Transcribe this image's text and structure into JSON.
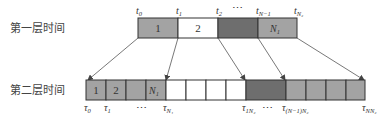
{
  "rows": {
    "top": {
      "label": "第一层时间"
    },
    "bottom": {
      "label": "第二层时间"
    }
  },
  "top_row": {
    "cells": [
      {
        "text": "1",
        "fill": "#a3a3a3"
      },
      {
        "text": "2",
        "fill": "#ffffff"
      },
      {
        "text": "",
        "fill": "#6e6e6e"
      },
      {
        "text": "N",
        "sub": "1",
        "fill": "#a3a3a3"
      }
    ],
    "ticks": [
      {
        "base": "t",
        "sub": "0"
      },
      {
        "base": "t",
        "sub": "1"
      },
      {
        "base": "t",
        "sub": "2"
      },
      {
        "base": "⋯",
        "sub": ""
      },
      {
        "base": "t",
        "sub": "N−1"
      },
      {
        "base": "t",
        "sub": "N₂"
      }
    ]
  },
  "bottom_row": {
    "cells": [
      {
        "text": "1",
        "fill": "#a3a3a3"
      },
      {
        "text": "2",
        "fill": "#a3a3a3"
      },
      {
        "text": "",
        "fill": "#a3a3a3"
      },
      {
        "text": "N",
        "sub": "1",
        "fill": "#a3a3a3"
      },
      {
        "text": "",
        "fill": "#ffffff"
      },
      {
        "text": "",
        "fill": "#ffffff"
      },
      {
        "text": "",
        "fill": "#ffffff"
      },
      {
        "text": "",
        "fill": "#ffffff"
      },
      {
        "text": "",
        "fill": "#6e6e6e"
      },
      {
        "text": "",
        "fill": "#a3a3a3"
      },
      {
        "text": "",
        "fill": "#a3a3a3"
      },
      {
        "text": "",
        "fill": "#a3a3a3"
      },
      {
        "text": "",
        "fill": "#a3a3a3"
      }
    ],
    "ticks": [
      {
        "base": "τ",
        "sub": "0"
      },
      {
        "base": "τ",
        "sub": "1"
      },
      {
        "base": "⋯",
        "sub": ""
      },
      {
        "base": "τ",
        "sub": "N₁"
      },
      {
        "base": "τ",
        "sub": "1N₂"
      },
      {
        "base": "⋯",
        "sub": ""
      },
      {
        "base": "τ",
        "sub": "(N−1)N₂"
      },
      {
        "base": "τ",
        "sub": "NN₂"
      }
    ]
  },
  "colors": {
    "light_gray": "#a3a3a3",
    "dark_gray": "#6e6e6e",
    "line": "#555555"
  }
}
